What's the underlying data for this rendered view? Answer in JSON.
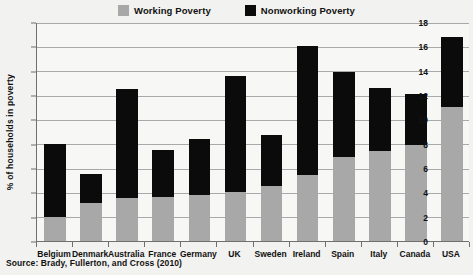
{
  "legend": {
    "position": "top-center",
    "entries": [
      {
        "label": "Working Poverty",
        "color": "#a8a8a8",
        "swatch_name": "working-poverty-swatch"
      },
      {
        "label": "Nonworking Poverty",
        "color": "#0b0b0b",
        "swatch_name": "nonworking-poverty-swatch"
      }
    ]
  },
  "source": "Source: Brady, Fullerton, and Cross (2010)",
  "chart_data": {
    "type": "bar",
    "stacked": true,
    "title": "",
    "xlabel": "",
    "ylabel": "% of households in poverty",
    "ylim": [
      0,
      18
    ],
    "ytick_step": 2,
    "yticks": [
      0,
      2,
      4,
      6,
      8,
      10,
      12,
      14,
      16,
      18
    ],
    "grid": true,
    "grid_axis": "y",
    "legend_entries": [
      "Working Poverty",
      "Nonworking Poverty"
    ],
    "categories": [
      "Belgium",
      "Denmark",
      "Australia",
      "France",
      "Germany",
      "UK",
      "Sweden",
      "Ireland",
      "Spain",
      "Italy",
      "Canada",
      "USA"
    ],
    "series": [
      {
        "name": "Working Poverty",
        "color": "#a8a8a8",
        "values": [
          2.0,
          3.1,
          3.5,
          3.6,
          3.8,
          4.0,
          4.5,
          5.4,
          6.9,
          7.4,
          7.9,
          11.0
        ]
      },
      {
        "name": "Nonworking Poverty",
        "color": "#0b0b0b",
        "values": [
          6.0,
          2.4,
          9.0,
          3.9,
          4.6,
          9.6,
          4.2,
          10.6,
          7.0,
          5.2,
          4.2,
          5.8
        ]
      }
    ],
    "totals": [
      8.0,
      5.5,
      12.5,
      7.5,
      8.4,
      13.6,
      8.7,
      16.0,
      13.9,
      12.6,
      12.1,
      16.8
    ]
  }
}
